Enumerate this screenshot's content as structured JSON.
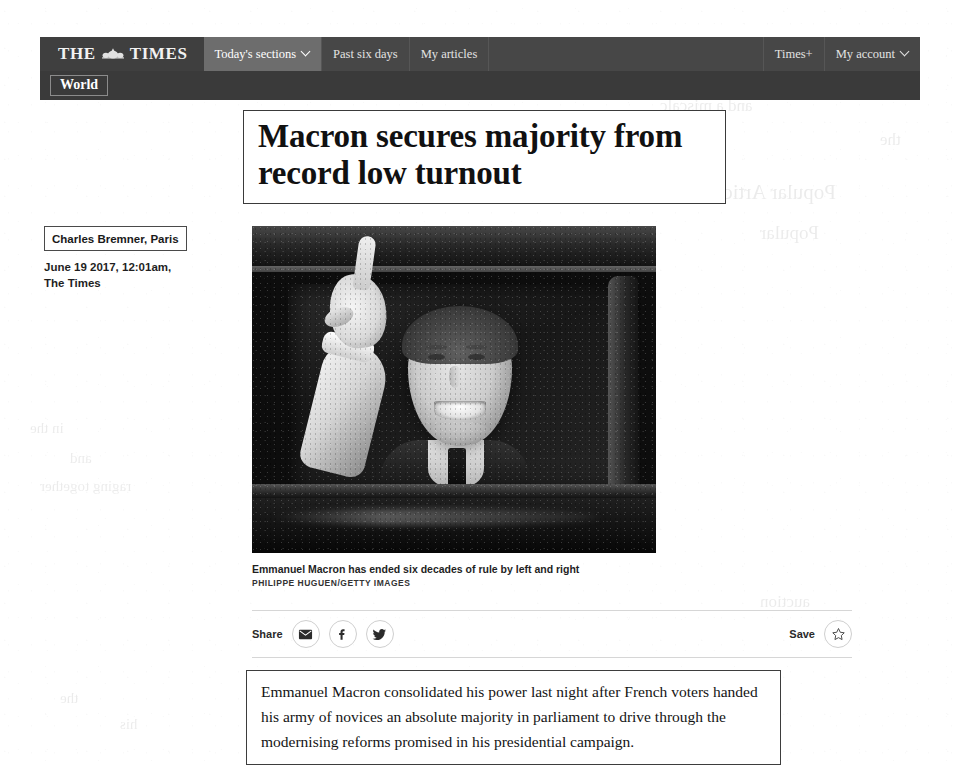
{
  "site": {
    "brand_the": "THE",
    "brand_times": "TIMES",
    "crest_icon": "times-crest-icon"
  },
  "nav": {
    "primary": [
      {
        "label": "Today's sections",
        "icon": "chevron-down-icon",
        "active": true,
        "has_caret": true
      },
      {
        "label": "Past six days",
        "active": false,
        "has_caret": false
      },
      {
        "label": "My articles",
        "active": false,
        "has_caret": false
      }
    ],
    "right": [
      {
        "label": "Times+",
        "has_caret": false
      },
      {
        "label": "My account",
        "icon": "chevron-down-icon",
        "has_caret": true
      }
    ],
    "section": "World"
  },
  "article": {
    "headline": "Macron secures majority from record low turnout",
    "byline_author": "Charles Bremner, Paris",
    "byline_meta": "June 19 2017, 12:01am,\nThe Times",
    "photo": {
      "alt": "Emmanuel Macron waving from a car window",
      "caption": "Emmanuel Macron has ended six decades of rule by left and right",
      "credit": "PHILIPPE HUGUEN/GETTY IMAGES"
    },
    "standfirst": "Emmanuel Macron consolidated his power last night after French voters handed his army of novices an absolute majority in parliament to drive through the modernising reforms promised in his presidential campaign."
  },
  "actions": {
    "share_label": "Share",
    "save_label": "Save",
    "share_buttons": [
      {
        "name": "share-email-button",
        "icon": "email-icon"
      },
      {
        "name": "share-facebook-button",
        "icon": "facebook-icon"
      },
      {
        "name": "share-twitter-button",
        "icon": "twitter-icon"
      }
    ],
    "save_button": {
      "name": "save-article-button",
      "icon": "star-outline-icon"
    }
  },
  "colors": {
    "nav_bar": "#474747",
    "nav_active": "#6d6d6d",
    "nav_secondary": "#3a3a3a",
    "page_background": "#ffffff",
    "text": "#141414"
  },
  "scan_ghosts": [
    {
      "text": "Popular Articles",
      "left": 700,
      "top": 180,
      "size": 21
    },
    {
      "text": "Popular",
      "left": 760,
      "top": 222,
      "size": 19
    },
    {
      "text": "and a miscalc",
      "left": 660,
      "top": 96,
      "size": 17
    },
    {
      "text": "the",
      "left": 880,
      "top": 130,
      "size": 17
    },
    {
      "text": "his",
      "left": 830,
      "top": 60,
      "size": 16
    },
    {
      "text": "in the",
      "left": 30,
      "top": 420,
      "size": 15
    },
    {
      "text": "and",
      "left": 70,
      "top": 450,
      "size": 15
    },
    {
      "text": "raging together",
      "left": 40,
      "top": 478,
      "size": 15
    },
    {
      "text": "auction",
      "left": 760,
      "top": 592,
      "size": 17
    },
    {
      "text": "the",
      "left": 60,
      "top": 690,
      "size": 15
    },
    {
      "text": "his",
      "left": 120,
      "top": 716,
      "size": 15
    }
  ]
}
